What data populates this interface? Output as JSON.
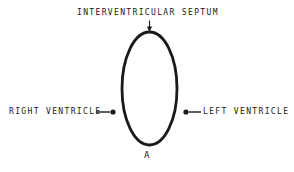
{
  "figure": {
    "panel_label": "A",
    "background_color": "#ffffff",
    "ink_color": "#1a1a1a",
    "shape": {
      "name": "ventricular-cross-section-ellipse",
      "center_x": 149.5,
      "center_y": 88.5,
      "radius_x": 27.5,
      "radius_y": 56.5,
      "stroke_width": 2.8,
      "fill": "none"
    },
    "annotations": [
      {
        "id": "septum",
        "text": "INTERVENTRICULAR SEPTUM",
        "position": "top",
        "connector": "arrow",
        "arrow_x": 149.5,
        "arrow_from_y": 20,
        "arrow_to_y": 31
      },
      {
        "id": "right-ventricle",
        "text": "RIGHT VENTRICLE",
        "position": "left",
        "connector": "line-dot",
        "line_from_x": 96,
        "line_to_x": 110,
        "dot_x": 113,
        "dot_y": 112,
        "dot_radius": 2.6
      },
      {
        "id": "left-ventricle",
        "text": "LEFT VENTRICLE",
        "position": "right",
        "connector": "dot-line",
        "line_from_x": 189,
        "line_to_x": 201,
        "dot_x": 186,
        "dot_y": 112,
        "dot_radius": 2.6
      }
    ]
  }
}
